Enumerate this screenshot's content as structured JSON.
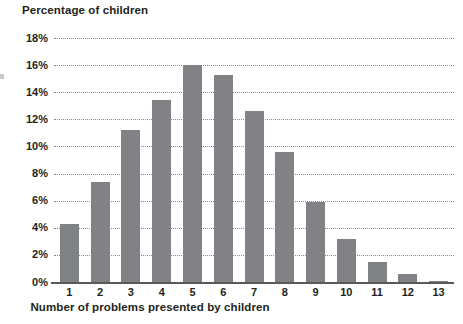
{
  "chart_data": {
    "type": "bar",
    "title": "",
    "xlabel": "Number of problems presented by children",
    "ylabel": "Percentage of children",
    "categories": [
      "1",
      "2",
      "3",
      "4",
      "5",
      "6",
      "7",
      "8",
      "9",
      "10",
      "11",
      "12",
      "13"
    ],
    "values": [
      4.3,
      7.4,
      11.2,
      13.4,
      16.0,
      15.3,
      12.6,
      9.6,
      5.9,
      3.2,
      1.5,
      0.6,
      0.1
    ],
    "value_labels": [
      "4.3%",
      "7.4%",
      "11.2%",
      "13.4%",
      "16.0%",
      "15.3%",
      "12.6%",
      "9.6%",
      "5.9%",
      "3.2%",
      "1.5%",
      "0.6%",
      "0.1%"
    ],
    "ylim": [
      0,
      18
    ],
    "ytick_labels": [
      "18%",
      "16%",
      "14%",
      "12%",
      "10%",
      "8%",
      "6%",
      "4%",
      "2%",
      "0%"
    ],
    "ytick_values": [
      18,
      16,
      14,
      12,
      10,
      8,
      6,
      4,
      2,
      0
    ],
    "grid": true,
    "legend": "none",
    "bar_color": "#808285",
    "axis_color": "#58595b",
    "gridline_color": "#8a8a8a",
    "text_color": "#231f20"
  }
}
